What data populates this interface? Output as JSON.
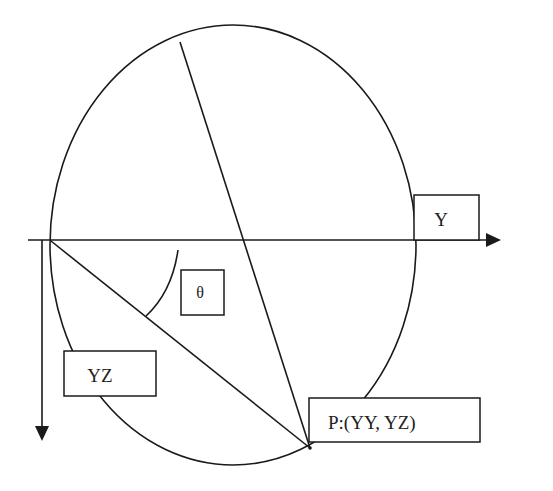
{
  "diagram": {
    "title": "",
    "labels": {
      "y_axis_label": "Y",
      "angle_label": "θ",
      "vertical_label": "YZ",
      "point_label": "P:(YY, YZ)"
    },
    "elements": [
      {
        "type": "ellipse",
        "name": "circle"
      },
      {
        "type": "line",
        "name": "diameter",
        "description": "line from top of circle to point P"
      },
      {
        "type": "line",
        "name": "chord",
        "description": "line from origin to point P"
      },
      {
        "type": "arc",
        "name": "angle-arc",
        "label": "θ"
      },
      {
        "type": "arrow",
        "name": "horizontal-axis",
        "label": "Y"
      },
      {
        "type": "arrow",
        "name": "vertical-axis",
        "label": "YZ"
      }
    ],
    "colors": {
      "line": "#1a1a1a",
      "background": "#ffffff"
    }
  }
}
